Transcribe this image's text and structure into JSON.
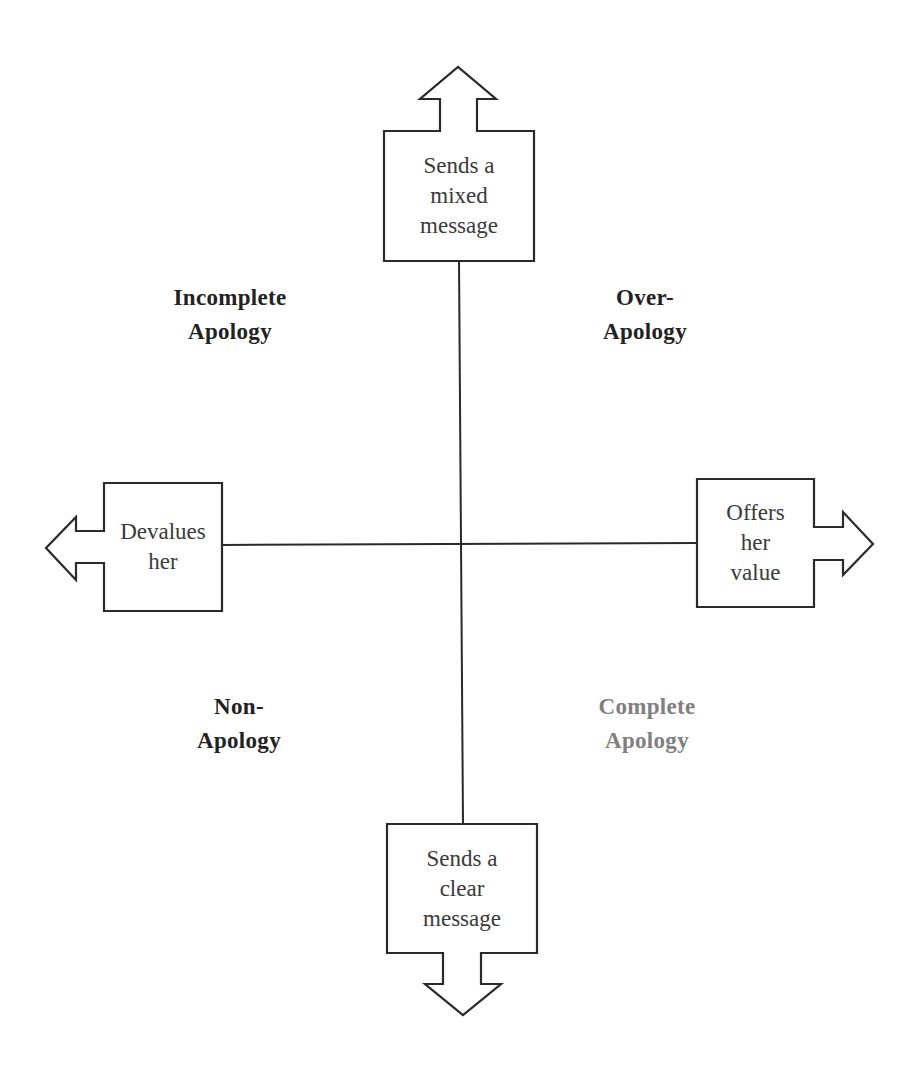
{
  "diagram": {
    "type": "quadrant",
    "axes": {
      "vertical": {
        "top": {
          "lines": [
            "Sends a",
            "mixed",
            "message"
          ]
        },
        "bottom": {
          "lines": [
            "Sends a",
            "clear",
            "message"
          ]
        }
      },
      "horizontal": {
        "left": {
          "lines": [
            "Devalues",
            "her"
          ]
        },
        "right": {
          "lines": [
            "Offers",
            "her",
            "value"
          ]
        }
      }
    },
    "quadrants": {
      "top_left": {
        "lines": [
          "Incomplete",
          "Apology"
        ],
        "color": "#222222"
      },
      "top_right": {
        "lines": [
          "Over-",
          "Apology"
        ],
        "color": "#222222"
      },
      "bottom_left": {
        "lines": [
          "Non-",
          "Apology"
        ],
        "color": "#222222"
      },
      "bottom_right": {
        "lines": [
          "Complete",
          "Apology"
        ],
        "color": "#808080"
      }
    }
  }
}
